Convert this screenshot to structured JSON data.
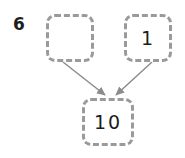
{
  "problem": {
    "number": "6",
    "type": "number-bond-addition-diagram"
  },
  "boxes": {
    "addend_left": {
      "label": "addend-box-left",
      "value": "",
      "state": "empty"
    },
    "addend_right": {
      "label": "addend-box-right",
      "value": "1"
    },
    "sum": {
      "label": "sum-box",
      "value": "10"
    }
  },
  "arrows": [
    {
      "name": "arrow-left-to-sum",
      "from": "addend_left",
      "to": "sum"
    },
    {
      "name": "arrow-right-to-sum",
      "from": "addend_right",
      "to": "sum"
    }
  ],
  "colors": {
    "box_border": "#9a9a9a",
    "arrow": "#8c8c8c",
    "text": "#1d1d1b",
    "background": "#ffffff"
  }
}
